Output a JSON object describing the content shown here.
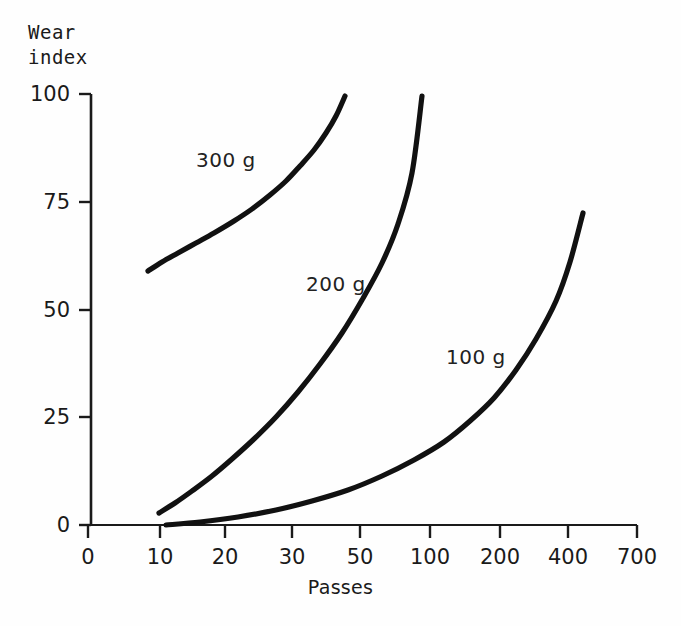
{
  "chart_data": {
    "type": "line",
    "title": "",
    "xlabel": "Passes",
    "ylabel": "Wear\nindex",
    "ylabel_line1": "Wear",
    "ylabel_line2": "index",
    "xscale": "log-like (non-uniform ticks)",
    "yscale": "linear",
    "xlim": [
      0,
      700
    ],
    "ylim": [
      0,
      100
    ],
    "grid": false,
    "legend": "inline curve labels",
    "xticks": [
      {
        "value": 0,
        "label": "0",
        "px": 88
      },
      {
        "value": 10,
        "label": "10",
        "px": 160
      },
      {
        "value": 20,
        "label": "20",
        "px": 225
      },
      {
        "value": 30,
        "label": "30",
        "px": 292
      },
      {
        "value": 50,
        "label": "50",
        "px": 360
      },
      {
        "value": 100,
        "label": "100",
        "px": 430
      },
      {
        "value": 200,
        "label": "200",
        "px": 500
      },
      {
        "value": 400,
        "label": "400",
        "px": 568
      },
      {
        "value": 700,
        "label": "700",
        "px": 637
      }
    ],
    "yticks": [
      {
        "value": 0,
        "label": "0",
        "px": 525
      },
      {
        "value": 25,
        "label": "25",
        "px": 417
      },
      {
        "value": 50,
        "label": "50",
        "px": 310
      },
      {
        "value": 75,
        "label": "75",
        "px": 202
      },
      {
        "value": 100,
        "label": "100",
        "px": 94
      }
    ],
    "series": [
      {
        "name": "300 g",
        "label": "300 g",
        "label_px": {
          "x": 196,
          "y": 148
        },
        "points_px": [
          [
            148,
            271
          ],
          [
            162,
            262
          ],
          [
            178,
            253
          ],
          [
            196,
            243
          ],
          [
            214,
            233
          ],
          [
            234,
            221
          ],
          [
            252,
            209
          ],
          [
            270,
            195
          ],
          [
            286,
            181
          ],
          [
            300,
            166
          ],
          [
            314,
            150
          ],
          [
            326,
            133
          ],
          [
            336,
            116
          ],
          [
            345,
            96
          ]
        ],
        "data_points": [
          {
            "passes": 9.5,
            "wear_index": 59
          },
          {
            "passes": 12,
            "wear_index": 61
          },
          {
            "passes": 15,
            "wear_index": 63
          },
          {
            "passes": 19,
            "wear_index": 65
          },
          {
            "passes": 23,
            "wear_index": 68
          },
          {
            "passes": 27,
            "wear_index": 71
          },
          {
            "passes": 31,
            "wear_index": 73
          },
          {
            "passes": 35,
            "wear_index": 77
          },
          {
            "passes": 38,
            "wear_index": 80
          },
          {
            "passes": 41,
            "wear_index": 83
          },
          {
            "passes": 43,
            "wear_index": 87
          },
          {
            "passes": 44,
            "wear_index": 91
          },
          {
            "passes": 45,
            "wear_index": 95
          },
          {
            "passes": 46,
            "wear_index": 100
          }
        ]
      },
      {
        "name": "200 g",
        "label": "200 g",
        "label_px": {
          "x": 306,
          "y": 272
        },
        "points_px": [
          [
            159,
            513
          ],
          [
            175,
            503
          ],
          [
            192,
            491
          ],
          [
            212,
            476
          ],
          [
            232,
            459
          ],
          [
            254,
            439
          ],
          [
            276,
            417
          ],
          [
            298,
            392
          ],
          [
            320,
            364
          ],
          [
            342,
            333
          ],
          [
            362,
            300
          ],
          [
            382,
            263
          ],
          [
            398,
            224
          ],
          [
            412,
            173
          ],
          [
            422,
            96
          ]
        ],
        "data_points": [
          {
            "passes": 10,
            "wear_index": 2.8
          },
          {
            "passes": 12,
            "wear_index": 5
          },
          {
            "passes": 14.5,
            "wear_index": 8
          },
          {
            "passes": 17.5,
            "wear_index": 11
          },
          {
            "passes": 21,
            "wear_index": 15
          },
          {
            "passes": 25,
            "wear_index": 20
          },
          {
            "passes": 29,
            "wear_index": 25
          },
          {
            "passes": 34,
            "wear_index": 31
          },
          {
            "passes": 41,
            "wear_index": 37
          },
          {
            "passes": 49,
            "wear_index": 45
          },
          {
            "passes": 58,
            "wear_index": 52
          },
          {
            "passes": 68,
            "wear_index": 61
          },
          {
            "passes": 78,
            "wear_index": 70
          },
          {
            "passes": 87,
            "wear_index": 82
          },
          {
            "passes": 95,
            "wear_index": 100
          }
        ]
      },
      {
        "name": "100 g",
        "label": "100 g",
        "label_px": {
          "x": 446,
          "y": 345
        },
        "points_px": [
          [
            166,
            525
          ],
          [
            200,
            522
          ],
          [
            238,
            517
          ],
          [
            276,
            510
          ],
          [
            312,
            501
          ],
          [
            348,
            490
          ],
          [
            382,
            476
          ],
          [
            414,
            460
          ],
          [
            444,
            442
          ],
          [
            470,
            421
          ],
          [
            494,
            398
          ],
          [
            516,
            370
          ],
          [
            536,
            339
          ],
          [
            556,
            301
          ],
          [
            570,
            262
          ],
          [
            583,
            213
          ]
        ],
        "data_points": [
          {
            "passes": 11,
            "wear_index": 0
          },
          {
            "passes": 14.5,
            "wear_index": 0.7
          },
          {
            "passes": 21,
            "wear_index": 1.9
          },
          {
            "passes": 28,
            "wear_index": 3.5
          },
          {
            "passes": 38,
            "wear_index": 5.6
          },
          {
            "passes": 48,
            "wear_index": 8.1
          },
          {
            "passes": 63,
            "wear_index": 11.4
          },
          {
            "passes": 83,
            "wear_index": 15.1
          },
          {
            "passes": 110,
            "wear_index": 19.3
          },
          {
            "passes": 143,
            "wear_index": 24.1
          },
          {
            "passes": 185,
            "wear_index": 29.5
          },
          {
            "passes": 235,
            "wear_index": 36
          },
          {
            "passes": 290,
            "wear_index": 43.2
          },
          {
            "passes": 355,
            "wear_index": 52
          },
          {
            "passes": 405,
            "wear_index": 61
          },
          {
            "passes": 450,
            "wear_index": 72.4
          }
        ]
      }
    ]
  },
  "style": {
    "background": "#fefefe",
    "axis_color": "#1a1a1a",
    "curve_color": "#111111",
    "text_color": "#1a1a1a"
  }
}
